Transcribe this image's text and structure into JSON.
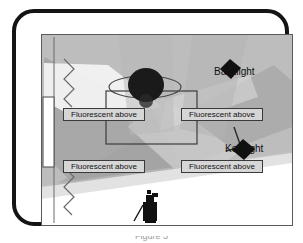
{
  "figure": {
    "kind": "studio-lighting-floorplan-diagram",
    "caption": "Figure 3"
  },
  "frame": {
    "outer_border_color": "#141414",
    "inner_border_color": "#5a5a5a",
    "page_background": "#ffffff"
  },
  "colors": {
    "floor_fill": "#bdbdbd",
    "beam_light": "#d8d8d8",
    "beam_mid": "#a9a9a9",
    "beam_dark": "#9a9a9a",
    "highlight_white": "#f2f2f2",
    "fixture_fill": "#d6d6d6",
    "fixture_stroke": "#3a3a3a",
    "lamp_black": "#101010",
    "subject_black": "#141414",
    "line_gray": "#555555",
    "text_color": "#111111"
  },
  "fixtures": [
    {
      "id": "fluor-top-left",
      "label": "Fluorescent above"
    },
    {
      "id": "fluor-top-right",
      "label": "Fluorescent above"
    },
    {
      "id": "fluor-bottom-left",
      "label": "Fluorescent above"
    },
    {
      "id": "fluor-bottom-right",
      "label": "Fluorescent above"
    }
  ],
  "lights": [
    {
      "id": "backlight",
      "label": "Backlight",
      "shape": "diamond",
      "position": "upper-right",
      "fill": "#101010"
    },
    {
      "id": "key-light",
      "label": "Key light",
      "shape": "diamond",
      "position": "mid-right",
      "fill": "#101010",
      "has_stand": true
    }
  ],
  "subject": {
    "id": "seated-subject",
    "description": "dark round head with elliptical table outline",
    "head_fill": "#141414",
    "table_outline": "#4a4a4a"
  },
  "camera": {
    "id": "camera-operator",
    "description": "camera operator silhouette at bottom center",
    "fill": "#111111"
  },
  "room_features": [
    {
      "id": "curtain-upper",
      "type": "zigzag-curtain",
      "side": "left-top"
    },
    {
      "id": "curtain-lower",
      "type": "zigzag-curtain",
      "side": "left-bottom"
    },
    {
      "id": "window-panel",
      "type": "vertical-white-panel",
      "side": "left-middle"
    },
    {
      "id": "center-table",
      "type": "rectangle-outline",
      "position": "center"
    }
  ]
}
